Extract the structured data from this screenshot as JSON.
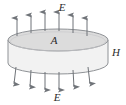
{
  "figure": {
    "kind": "gaussian-pillbox-diagram",
    "background_color": "#ffffff",
    "stroke_color": "#8f9296",
    "arrow_color": "#6f7378",
    "label_color": "#2b2b2b",
    "top_face_fill": "#dcdcdc",
    "side_fill": "#f2f2f2",
    "labels": {
      "field_top": "E",
      "area_top_face": "A",
      "height_side": "H",
      "field_bottom": "E"
    },
    "cylinder": {
      "center_x": 58,
      "radius_x": 50,
      "radius_y": 11,
      "top_center_y": 40,
      "bottom_center_y": 63,
      "height_px": 23
    },
    "arrows_up": {
      "count": 6,
      "direction": "up",
      "label": "E",
      "x_positions": [
        17,
        31,
        45,
        59,
        73,
        87
      ],
      "base_y": [
        36,
        33,
        31,
        31,
        33,
        36
      ],
      "length": 20
    },
    "arrows_down": {
      "count": 6,
      "direction": "down",
      "label": "E",
      "x_positions": [
        17,
        31,
        45,
        59,
        73,
        87
      ],
      "base_y": [
        68,
        71,
        73,
        73,
        71,
        68
      ],
      "length": 20
    }
  }
}
